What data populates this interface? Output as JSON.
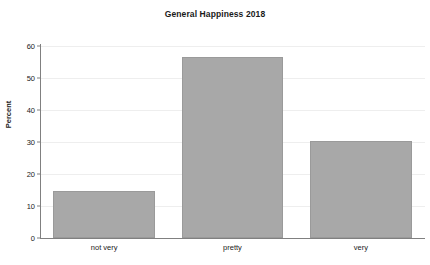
{
  "chart_data": {
    "type": "bar",
    "title": "General Happiness 2018",
    "xlabel": "",
    "ylabel": "Percent",
    "categories": [
      "not very",
      "pretty",
      "very"
    ],
    "values": [
      14.8,
      56.5,
      30.4
    ],
    "ylim": [
      0,
      62
    ],
    "yticks": [
      0,
      10,
      20,
      30,
      40,
      50,
      60
    ],
    "ytick_labels": [
      "0",
      "10",
      "20",
      "30",
      "40",
      "50",
      "60"
    ],
    "grid": true,
    "legend": false,
    "bar_color": "#a8a8a8",
    "bar_edge_color": "#9a9a9a",
    "grid_color": "#eeeeee",
    "axis_color": "#808080",
    "background": "#ffffff"
  }
}
